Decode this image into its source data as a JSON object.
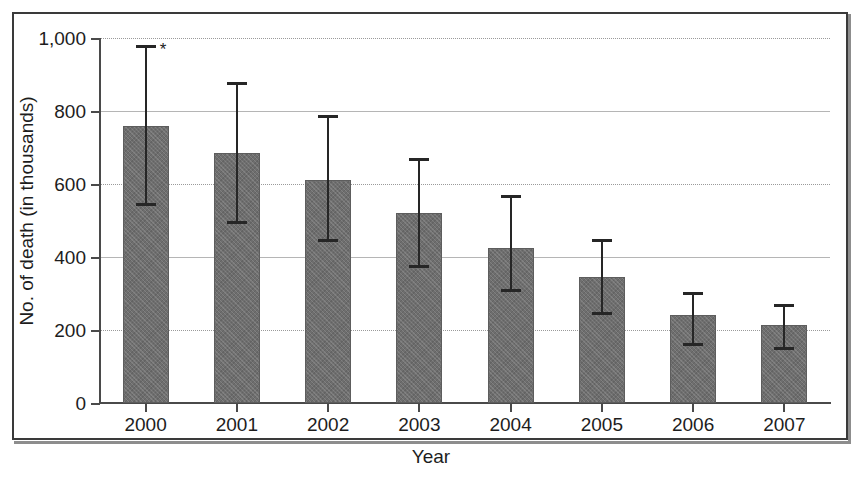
{
  "figure": {
    "frame_color": "#3a3a3a",
    "background": "#ffffff",
    "bar_color": "#6e6e6e",
    "error_bar_color": "#262626"
  },
  "chart_data": {
    "type": "bar",
    "title": "",
    "xlabel": "Year",
    "ylabel": "No. of death (in thousands)",
    "categories": [
      "2000",
      "2001",
      "2002",
      "2003",
      "2004",
      "2005",
      "2006",
      "2007"
    ],
    "values": [
      760,
      685,
      610,
      520,
      425,
      345,
      240,
      215
    ],
    "error_high": [
      980,
      880,
      790,
      670,
      570,
      450,
      305,
      270
    ],
    "error_low": [
      540,
      490,
      440,
      370,
      305,
      240,
      155,
      145
    ],
    "ylim": [
      0,
      1000
    ],
    "yticks": [
      0,
      200,
      400,
      600,
      800,
      1000
    ],
    "ytick_labels": [
      "0",
      "200",
      "400",
      "600",
      "800",
      "1,000"
    ],
    "grid": true,
    "legend": "none",
    "annotations": [
      {
        "text": "*",
        "category": "2000",
        "note": "significance marker beside upper error bar cap of the 2000 bar"
      }
    ]
  },
  "axis": {
    "y_tick_0": "0",
    "y_tick_200": "200",
    "y_tick_400": "400",
    "y_tick_600": "600",
    "y_tick_800": "800",
    "y_tick_1000": "1,000",
    "y_title": "No. of death (in thousands)",
    "x_title": "Year",
    "x_tick_0": "2000",
    "x_tick_1": "2001",
    "x_tick_2": "2002",
    "x_tick_3": "2003",
    "x_tick_4": "2004",
    "x_tick_5": "2005",
    "x_tick_6": "2006",
    "x_tick_7": "2007"
  },
  "significance": {
    "marker": "*"
  }
}
